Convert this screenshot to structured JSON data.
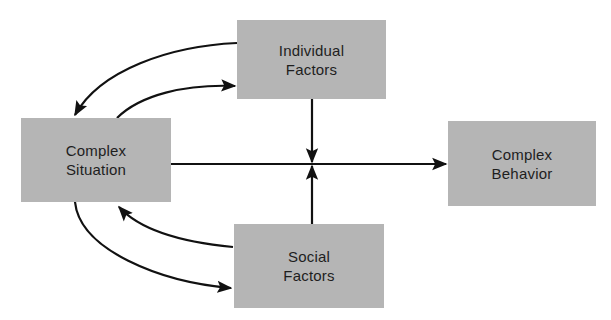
{
  "diagram": {
    "nodes": [
      {
        "id": "complex-situation",
        "line1": "Complex",
        "line2": "Situation"
      },
      {
        "id": "individual-factors",
        "line1": "Individual",
        "line2": "Factors"
      },
      {
        "id": "social-factors",
        "line1": "Social",
        "line2": "Factors"
      },
      {
        "id": "complex-behavior",
        "line1": "Complex",
        "line2": "Behavior"
      }
    ],
    "edges": [
      {
        "from": "individual-factors",
        "to": "complex-situation"
      },
      {
        "from": "complex-situation",
        "to": "individual-factors"
      },
      {
        "from": "social-factors",
        "to": "complex-situation"
      },
      {
        "from": "complex-situation",
        "to": "social-factors"
      },
      {
        "from": "complex-situation",
        "to": "complex-behavior"
      },
      {
        "from": "individual-factors",
        "to": "complex-situation-behavior-link"
      },
      {
        "from": "social-factors",
        "to": "complex-situation-behavior-link"
      }
    ],
    "colors": {
      "box_fill": "#b5b5b5",
      "line": "#111111",
      "text": "#1e1e1e"
    }
  }
}
